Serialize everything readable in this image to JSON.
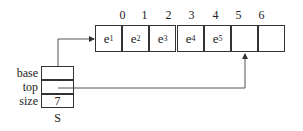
{
  "array": {
    "indices": [
      "0",
      "1",
      "2",
      "3",
      "4",
      "5",
      "6"
    ],
    "cells": [
      {
        "base": "e",
        "sub": "1"
      },
      {
        "base": "e",
        "sub": "2"
      },
      {
        "base": "e",
        "sub": "3"
      },
      {
        "base": "e",
        "sub": "4"
      },
      {
        "base": "e",
        "sub": "5"
      },
      {
        "base": "",
        "sub": ""
      },
      {
        "base": "",
        "sub": ""
      }
    ]
  },
  "struct": {
    "name": "S",
    "fields": [
      {
        "label": "base",
        "value": ""
      },
      {
        "label": "top",
        "value": ""
      },
      {
        "label": "size",
        "value": "7"
      }
    ]
  }
}
